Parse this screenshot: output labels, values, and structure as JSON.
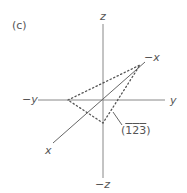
{
  "figure": {
    "panel_label": "(c)",
    "axes": {
      "z_pos": "z",
      "z_neg": "−z",
      "y_pos": "y",
      "y_neg": "−y",
      "x_pos": "x",
      "x_neg": "−x"
    },
    "plane": {
      "label_open": "(",
      "digits": [
        "1",
        "2",
        "3"
      ],
      "label_close": ")",
      "miller_indices": "(1̅2̅3̅)"
    },
    "colors": {
      "axis": "#777777",
      "plane": "#555555",
      "text": "#555555"
    }
  }
}
